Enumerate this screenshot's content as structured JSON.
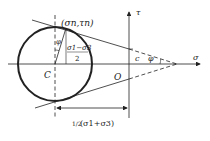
{
  "diagram": {
    "type": "Mohr-Coulomb failure envelope",
    "labels": {
      "tangent_point": "(σn,τn)",
      "tau_axis": "τ",
      "sigma_axis": "σ",
      "center": "C",
      "origin": "O",
      "cohesion": "c",
      "friction_angle": "φ",
      "angle_at_center": "φ",
      "radius_numerator": "σ1−σ3",
      "radius_denominator": "2",
      "center_distance_frac": "1/2",
      "center_distance_expr": "(σ1+σ3)"
    },
    "colors": {
      "stroke": "#222222",
      "background": "#ffffff"
    }
  }
}
